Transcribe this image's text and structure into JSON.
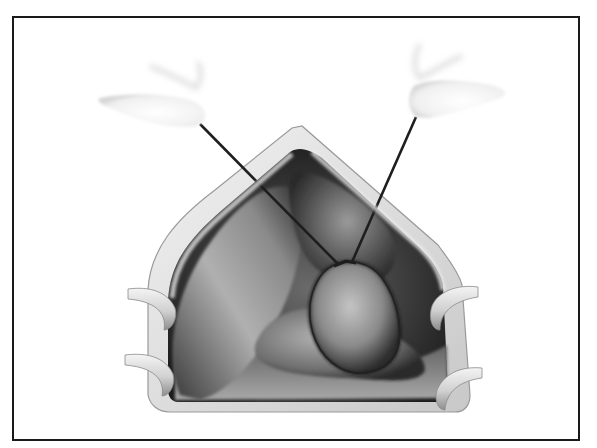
{
  "figure": {
    "type": "surgical-illustration",
    "style": "grayscale airbrushed medical drawing",
    "elements": [
      "left-gloved-fingertip",
      "right-gloved-fingertip",
      "left-stay-suture",
      "right-stay-suture",
      "wound-edge",
      "left-lobe-organ",
      "central-mass",
      "lower-organ",
      "left-retractor-upper",
      "left-retractor-lower",
      "right-retractor-upper",
      "right-retractor-lower"
    ]
  },
  "colors": {
    "frame_border": "#1a1a1a",
    "background": "#ffffff",
    "suture": "#1e1e1e",
    "wound_edge": "#d8d8d8",
    "cavity_dark": "#2a2a2a",
    "organ_light": "#b8b8b8"
  }
}
